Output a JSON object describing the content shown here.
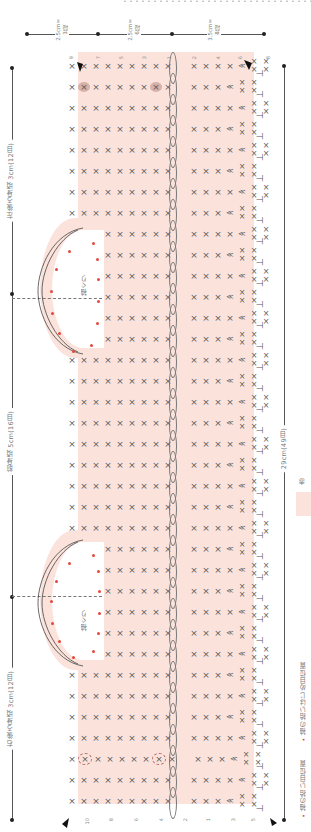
{
  "top_ruler": {
    "segments": [
      {
        "label_cm": "2.5cm=",
        "label_rows": "3段"
      },
      {
        "label_cm": "2.5cm=",
        "label_rows": "6段"
      },
      {
        "label_cm": "3.5cm=",
        "label_rows": "8段"
      }
    ]
  },
  "left_dimensions": [
    {
      "label": "左後ろ身頃 3cm(12目)"
    },
    {
      "label": "前身頃 5cm(16目)"
    },
    {
      "label": "右後ろ身頃 3cm(12目)"
    }
  ],
  "right_dimension": {
    "label": "29cm(49目)"
  },
  "armholes": [
    {
      "label": "袖ぐり"
    },
    {
      "label": "袖ぐり"
    }
  ],
  "legend": {
    "color_label": "赤",
    "color_hex": "#fbe3dc",
    "items": [
      {
        "marker": "•",
        "label": "袖の拾い目位置",
        "color": "#e4473e"
      },
      {
        "marker": "•",
        "label": "袖の拾いはじめ目位置",
        "color": "#e4473e"
      }
    ]
  },
  "stitch_symbols": {
    "single_crochet": "×",
    "increase": "≪",
    "chain": "○",
    "half_double": "T"
  },
  "row_numbers_top": [
    "9",
    "7",
    "5",
    "3",
    "1",
    "2",
    "4",
    "6",
    "8"
  ],
  "row_numbers_bottom": [
    "10",
    "8",
    "6",
    "4",
    "2",
    "1",
    "3",
    "5",
    "7"
  ],
  "colors": {
    "fabric": "#fbe3dc",
    "pickup_dot": "#e4473e",
    "line": "#555555"
  }
}
